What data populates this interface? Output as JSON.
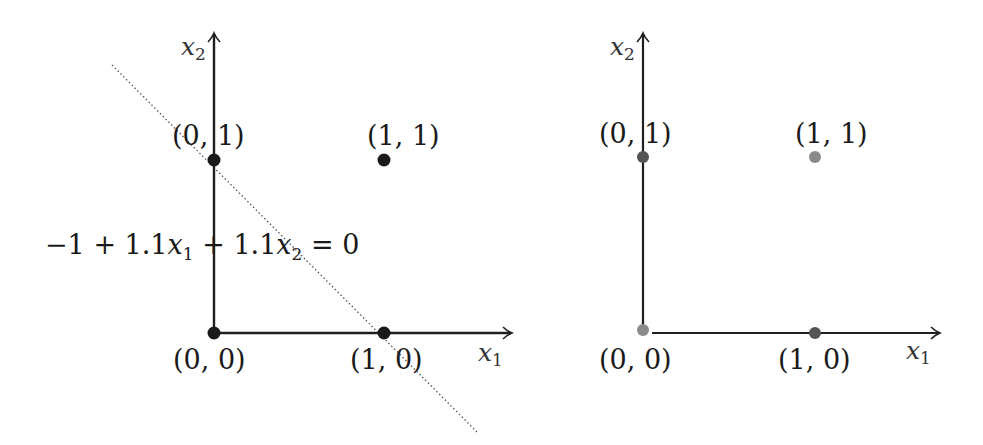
{
  "panels": [
    {
      "id": "left",
      "axis_x_label_var": "x",
      "axis_x_label_sub": "1",
      "axis_y_label_var": "x",
      "axis_y_label_sub": "2",
      "points": [
        {
          "label": "(0, 1)",
          "color": "#1a1a1a"
        },
        {
          "label": "(1, 1)",
          "color": "#1a1a1a"
        },
        {
          "label": "(0, 0)",
          "color": "#1a1a1a"
        },
        {
          "label": "(1, 0)",
          "color": "#1a1a1a"
        }
      ],
      "decision_boundary": {
        "style": "dotted",
        "eq_prefix": "−1 + 1.1",
        "eq_var1": "x",
        "eq_sub1": "1",
        "eq_mid": " + 1.1",
        "eq_var2": "x",
        "eq_sub2": "2",
        "eq_suffix": " = 0"
      }
    },
    {
      "id": "right",
      "axis_x_label_var": "x",
      "axis_x_label_sub": "1",
      "axis_y_label_var": "x",
      "axis_y_label_sub": "2",
      "points": [
        {
          "label": "(0, 1)",
          "color": "#555555"
        },
        {
          "label": "(1, 1)",
          "color": "#8a8a8a"
        },
        {
          "label": "(0, 0)",
          "color": "#8a8a8a"
        },
        {
          "label": "(1, 0)",
          "color": "#555555"
        }
      ]
    }
  ],
  "colors": {
    "axis": "#1f1f1f",
    "boundary": "#555555",
    "dark_point": "#555555",
    "light_point": "#8a8a8a"
  }
}
